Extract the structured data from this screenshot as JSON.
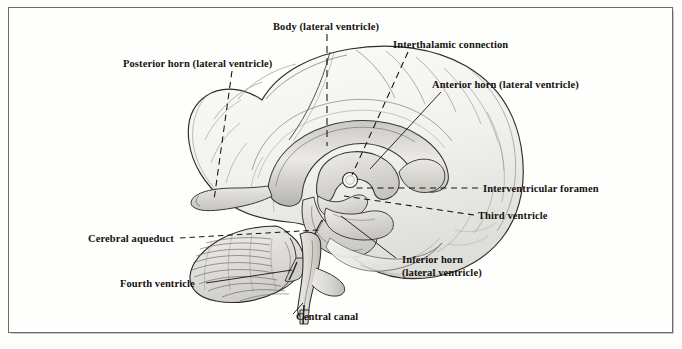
{
  "figure": {
    "kind": "anatomical-illustration",
    "style": "black-and-white pen-and-ink with grey wash",
    "frame_color": "#6a6a6a",
    "background_color": "#fefefd",
    "ink_color": "#14120f"
  },
  "labels": [
    {
      "id": "body-lateral-ventricle",
      "text": "Body (lateral ventricle)",
      "x": 273,
      "y": 20,
      "leader": "vertical dashed line down to corpus callosum body"
    },
    {
      "id": "interthalamic-connection",
      "text": "Interthalamic connection",
      "x": 393,
      "y": 38,
      "leader": "long dashed diagonal down-left to thalamic circle"
    },
    {
      "id": "posterior-horn-lateral-ventricle",
      "text": "Posterior horn (lateral ventricle)",
      "x": 123,
      "y": 57,
      "leader": "dashed diagonal down-right to occipital horn"
    },
    {
      "id": "anterior-horn-lateral-ventricle",
      "text": "Anterior horn (lateral ventricle)",
      "x": 432,
      "y": 78,
      "leader": "solid diagonal down-left to frontal horn"
    },
    {
      "id": "interventricular-foramen",
      "text": "Interventricular foramen",
      "x": 483,
      "y": 182,
      "leader": "long horizontal dashed line left to foramen of Monro"
    },
    {
      "id": "third-ventricle",
      "text": "Third ventricle",
      "x": 478,
      "y": 209,
      "leader": "dashed line left to third ventricle cavity"
    },
    {
      "id": "cerebral-aqueduct",
      "text": "Cerebral aqueduct",
      "x": 88,
      "y": 232,
      "leader": "dashed horizontal line right to aqueduct of Sylvius"
    },
    {
      "id": "inferior-horn-lateral-ventricle",
      "line1": "Inferior horn",
      "line2": "(lateral ventricle)",
      "x": 402,
      "y": 253,
      "leader": "solid diagonal up-left to temporal horn"
    },
    {
      "id": "fourth-ventricle",
      "text": "Fourth ventricle",
      "x": 120,
      "y": 277,
      "leader": "solid diagonal up-right to fourth ventricle"
    },
    {
      "id": "central-canal",
      "text": "Central canal",
      "x": 296,
      "y": 310,
      "leader": "short solid diagonal up-left to spinal central canal"
    }
  ]
}
